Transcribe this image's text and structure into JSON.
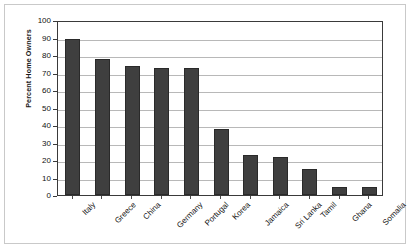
{
  "chart_data": {
    "type": "bar",
    "title": "",
    "xlabel": "",
    "ylabel": "Percent Home Owners",
    "ylim": [
      0,
      100
    ],
    "ytick_step": 10,
    "yticks": [
      100,
      90,
      80,
      70,
      60,
      50,
      40,
      30,
      20,
      10,
      0
    ],
    "grid": true,
    "legend": "none",
    "bar_color": "#3f3f3f",
    "categories": [
      "Italy",
      "Greece",
      "China",
      "Germany",
      "Portugal",
      "Korea",
      "Jamaica",
      "Sri Lanka",
      "Tamil",
      "Ghana",
      "Somalia"
    ],
    "values": [
      89,
      77.5,
      74,
      72.5,
      72.5,
      37.5,
      23,
      22,
      15,
      4.5,
      4.5
    ]
  },
  "figure": {
    "background": "#ffffff",
    "frame_color": "#c9c9c9",
    "axis_color": "#3a3a3a",
    "gridline_color": "#b8b8b8"
  }
}
